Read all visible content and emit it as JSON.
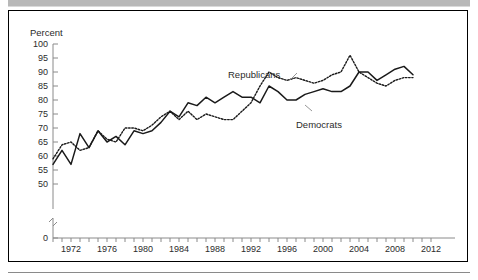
{
  "figure": {
    "background_color": "#ffffff",
    "border_color": "#000000",
    "top_band_color": "#b8b8b8"
  },
  "chart_data": {
    "type": "line",
    "title": "",
    "subtitle": "",
    "xlabel": "",
    "ylabel": "Percent",
    "ylim": [
      50,
      100
    ],
    "xlim": [
      1970,
      2012
    ],
    "grid": false,
    "legend_position": "inline-annotation",
    "y_axis_break": true,
    "y_axis_break_note": "axis breaks between 50 and 0",
    "yticks": [
      0,
      50,
      55,
      60,
      65,
      70,
      75,
      80,
      85,
      90,
      95,
      100
    ],
    "ytick_labels": [
      "0",
      "50",
      "55",
      "60",
      "65",
      "70",
      "75",
      "80",
      "85",
      "90",
      "95",
      "100"
    ],
    "xticks": [
      1972,
      1976,
      1980,
      1984,
      1988,
      1992,
      1996,
      2000,
      2004,
      2008,
      2012
    ],
    "xtick_labels": [
      "1972",
      "1976",
      "1980",
      "1984",
      "1988",
      "1992",
      "1996",
      "2000",
      "2004",
      "2008",
      "2012"
    ],
    "x_minor_tick_interval": 1,
    "annotations": [
      {
        "text": "Republicans",
        "x": 1994,
        "y": 90
      },
      {
        "text": "Democrats",
        "x": 1996,
        "y": 77
      }
    ],
    "x": [
      1970,
      1971,
      1972,
      1973,
      1974,
      1975,
      1976,
      1977,
      1978,
      1979,
      1980,
      1981,
      1982,
      1983,
      1984,
      1985,
      1986,
      1987,
      1988,
      1989,
      1990,
      1991,
      1992,
      1993,
      1994,
      1995,
      1996,
      1997,
      1998,
      1999,
      2000,
      2001,
      2002,
      2003,
      2004,
      2005,
      2006,
      2007,
      2008,
      2009,
      2010
    ],
    "series": [
      {
        "name": "Democrats",
        "style": "solid",
        "color": "#1a1a1a",
        "values": [
          57,
          62,
          57,
          68,
          63,
          69,
          65,
          67,
          64,
          69,
          68,
          69,
          72,
          76,
          74,
          79,
          78,
          81,
          79,
          81,
          83,
          81,
          81,
          79,
          85,
          83,
          80,
          80,
          82,
          83,
          84,
          83,
          83,
          85,
          90,
          90,
          87,
          89,
          91,
          92,
          89
        ]
      },
      {
        "name": "Republicans",
        "style": "dotted",
        "color": "#1a1a1a",
        "values": [
          59,
          64,
          65,
          62,
          63,
          69,
          66,
          65,
          70,
          70,
          69,
          71,
          74,
          76,
          73,
          76,
          73,
          75,
          74,
          73,
          73,
          76,
          79,
          85,
          90,
          88,
          87,
          88,
          87,
          86,
          87,
          89,
          90,
          96,
          90,
          88,
          86,
          85,
          87,
          88,
          88
        ]
      }
    ]
  }
}
